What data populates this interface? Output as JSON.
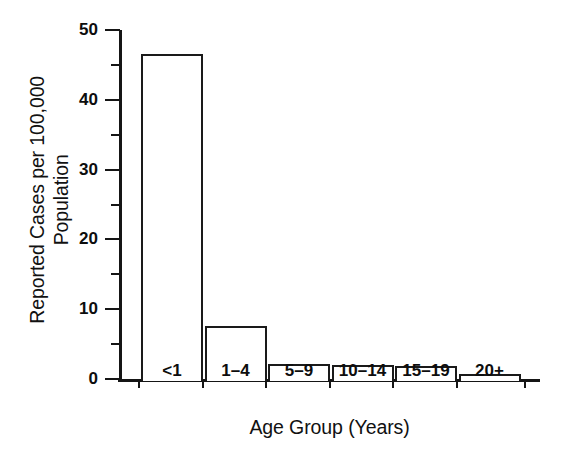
{
  "chart_data": {
    "type": "bar",
    "title": "",
    "subtitle": "",
    "xlabel": "Age Group (Years)",
    "ylabel_line1": "Reported Cases per 100,000",
    "ylabel_line2": "Population",
    "categories": [
      "<1",
      "1–4",
      "5–9",
      "10–14",
      "15–19",
      "20+"
    ],
    "values": [
      46.5,
      7.6,
      2.2,
      2.0,
      1.8,
      0.7
    ],
    "series": [
      {
        "name": "Reported cases per 100,000 population",
        "values": [
          46.5,
          7.6,
          2.2,
          2.0,
          1.8,
          0.7
        ]
      }
    ],
    "ylim": [
      0,
      50
    ],
    "y_major_ticks": [
      0,
      10,
      20,
      30,
      40,
      50
    ],
    "y_major_tick_labels": [
      "0",
      "10",
      "20",
      "30",
      "40",
      "50"
    ],
    "y_minor_ticks": [
      5,
      15,
      25,
      35,
      45
    ],
    "grid": false,
    "legend": false,
    "legend_position": "none",
    "bar_fill": "#ffffff",
    "bar_edge_color": "#1a1a1a",
    "axis_color": "#151515",
    "background": "#ffffff"
  }
}
